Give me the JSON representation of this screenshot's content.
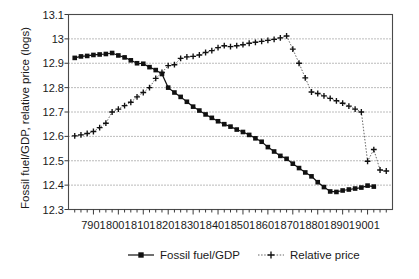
{
  "chart_data": {
    "type": "line",
    "title": "",
    "xlabel": "",
    "ylabel": "Fossil fuel/GDP, relative price (logs)",
    "ylim": [
      12.3,
      13.1
    ],
    "ytick_labels": [
      "12.3",
      "12.4",
      "12.5",
      "12.6",
      "12.7",
      "12.8",
      "12.9",
      "13",
      "13.1"
    ],
    "ytick_values": [
      12.3,
      12.4,
      12.5,
      12.6,
      12.7,
      12.8,
      12.9,
      13.0,
      13.1
    ],
    "grid": true,
    "legend_position": "bottom",
    "xtick_labels": [
      "7901",
      "8001",
      "8101",
      "8201",
      "8301",
      "8401",
      "8501",
      "8601",
      "8701",
      "8801",
      "8901",
      "9001"
    ],
    "x_minor_ticks_per_label": 4,
    "x": [
      "7802",
      "7803",
      "7804",
      "7901",
      "7902",
      "7903",
      "7904",
      "8001",
      "8002",
      "8003",
      "8004",
      "8101",
      "8102",
      "8103",
      "8104",
      "8201",
      "8202",
      "8203",
      "8204",
      "8301",
      "8302",
      "8303",
      "8304",
      "8401",
      "8402",
      "8403",
      "8404",
      "8501",
      "8502",
      "8503",
      "8504",
      "8601",
      "8602",
      "8603",
      "8604",
      "8701",
      "8702",
      "8703",
      "8704",
      "8801",
      "8802",
      "8803",
      "8804",
      "8901",
      "8902",
      "8903",
      "8904",
      "9001",
      "9002"
    ],
    "series": [
      {
        "name": "Fossil fuel/GDP",
        "marker": "filled-square",
        "line_style": "solid",
        "color": "#111111",
        "values": [
          12.922,
          12.928,
          12.93,
          12.934,
          12.936,
          12.938,
          12.942,
          12.932,
          12.924,
          12.912,
          12.9,
          12.898,
          12.884,
          12.872,
          12.856,
          12.8,
          12.78,
          12.762,
          12.742,
          12.722,
          12.706,
          12.69,
          12.676,
          12.662,
          12.65,
          12.64,
          12.628,
          12.618,
          12.606,
          12.592,
          12.578,
          12.556,
          12.538,
          12.52,
          12.508,
          12.488,
          12.47,
          12.452,
          12.436,
          12.412,
          12.392,
          12.374,
          12.372,
          12.378,
          12.382,
          12.386,
          12.39,
          12.398,
          12.394
        ]
      },
      {
        "name": "Relative price",
        "marker": "plus",
        "line_style": "dotted",
        "color": "#111111",
        "values": [
          12.602,
          12.606,
          12.612,
          12.62,
          12.636,
          12.654,
          12.7,
          12.712,
          12.726,
          12.74,
          12.762,
          12.78,
          12.8,
          12.838,
          12.862,
          12.89,
          12.894,
          12.92,
          12.926,
          12.928,
          12.934,
          12.944,
          12.952,
          12.964,
          12.972,
          12.968,
          12.972,
          12.976,
          12.982,
          12.986,
          12.99,
          12.994,
          12.998,
          13.004,
          13.012,
          12.958,
          12.9,
          12.84,
          12.782,
          12.776,
          12.766,
          12.756,
          12.746,
          12.736,
          12.724,
          12.712,
          12.7,
          12.498,
          12.546
        ]
      }
    ],
    "series_tail": {
      "note": "relative price tail after 9002",
      "x": [
        "9003",
        "9004"
      ],
      "values": [
        12.462,
        12.458
      ]
    },
    "annotations": []
  },
  "legend": {
    "items": [
      {
        "label": "Fossil fuel/GDP",
        "marker": "filled-square-icon",
        "line": "solid"
      },
      {
        "label": "Relative price",
        "marker": "plus-icon",
        "line": "dotted"
      }
    ]
  }
}
